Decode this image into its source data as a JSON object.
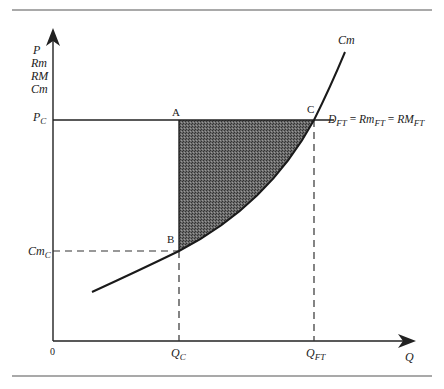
{
  "diagram": {
    "type": "economics-cost-revenue-diagram",
    "y_axis_labels": [
      "P",
      "Rm",
      "RM",
      "Cm"
    ],
    "x_axis_label": "Q",
    "origin_label": "0",
    "price_label": {
      "main": "P",
      "sub": "C"
    },
    "cost_label": {
      "main": "Cm",
      "sub": "C"
    },
    "qc_label": {
      "main": "Q",
      "sub": "C"
    },
    "qft_label": {
      "main": "Q",
      "sub": "FT"
    },
    "curve_label": "Cm",
    "demand_label": {
      "d": "D",
      "d_sub": "FT",
      "eq1": " = ",
      "rm": "Rm",
      "rm_sub": "FT",
      "eq2": " = ",
      "RM": "RM",
      "RM_sub": "FT"
    },
    "points": {
      "A": "A",
      "B": "B",
      "C": "C"
    },
    "shaded_region": "area ABC between price line P_C and Cm curve from Q_C to Q_FT",
    "colors": {
      "lines": "#1a1a1a",
      "shading": "#555555",
      "rule": "#555555"
    }
  }
}
